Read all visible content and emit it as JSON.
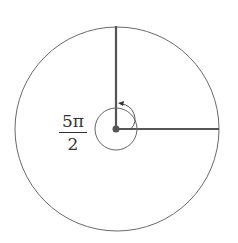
{
  "diagram": {
    "type": "angle-on-circle",
    "angle_label": {
      "numerator": "5π",
      "denominator": "2"
    },
    "angle_value": "5π/2",
    "colors": {
      "stroke": "#555555",
      "ray": "#555555",
      "background": "#ffffff"
    }
  }
}
